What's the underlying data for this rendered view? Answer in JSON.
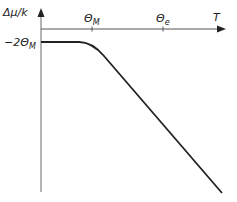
{
  "diagram": {
    "type": "schematic-curve",
    "x_axis": {
      "label": "T"
    },
    "y_axis": {
      "label": "Δμ/k"
    },
    "x_ticks": [
      {
        "symbol": "Θ",
        "subscript": "M"
      },
      {
        "symbol": "Θ",
        "subscript": "e"
      }
    ],
    "y_level_label": {
      "prefix": "−2Θ",
      "subscript": "M"
    },
    "curve_description": "Constant at -2Θ_M for low T, bends near Θ_M, then decreases linearly with T"
  },
  "colors": {
    "axis": "#555555",
    "curve": "#222222",
    "text": "#222222"
  }
}
